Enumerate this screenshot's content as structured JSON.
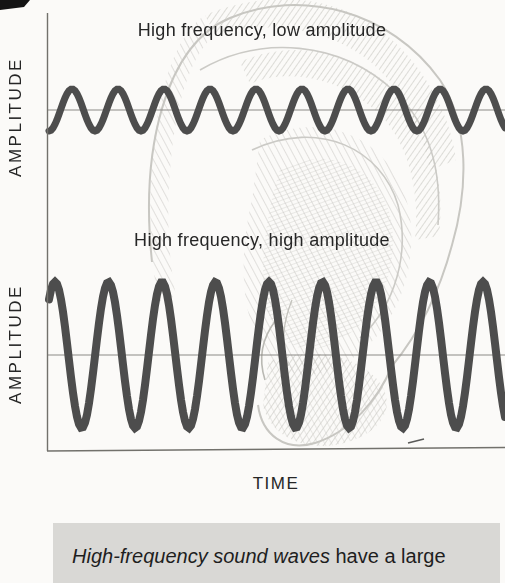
{
  "figure": {
    "panels": [
      {
        "title": "High frequency, low amplitude",
        "axis_label": "AMPLITUDE"
      },
      {
        "title": "High frequency, high amplitude",
        "axis_label": "AMPLITUDE"
      }
    ],
    "x_axis_label": "TIME",
    "waves": [
      {
        "name": "high-frequency-low-amplitude",
        "amplitude": "low",
        "cycles": 10,
        "y_center": 110,
        "amplitude_px": 21,
        "period_px": 46,
        "crest_x": 72,
        "x_start": 49,
        "x_end": 506,
        "stroke_width": 7
      },
      {
        "name": "high-frequency-high-amplitude",
        "amplitude": "high",
        "cycles": 9,
        "y_center": 355,
        "amplitude_px": 73,
        "period_px": 53.5,
        "crest_x": 55,
        "x_start": 49,
        "x_end": 506,
        "stroke_width": 8
      }
    ],
    "colors": {
      "page_bg": "#fbfaf8",
      "wave": "#4d4d4d",
      "axis": "#72716c",
      "midline": "#8b8a85",
      "text": "#262626",
      "caption_bg": "#d9d8d5",
      "ear_line": "#c2c1bc",
      "ear_hatch": "#bdbcb6"
    }
  },
  "caption": {
    "italic_text": "High-frequency sound waves",
    "regular_text": " have a large"
  }
}
